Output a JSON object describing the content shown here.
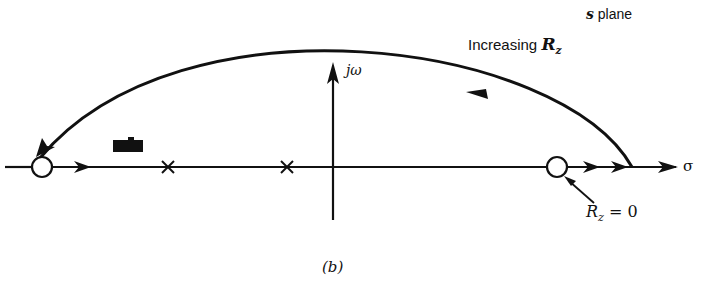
{
  "figure": {
    "plane_label_prefix": "s",
    "plane_label_suffix": " plane",
    "caption": "(b)",
    "colors": {
      "ink": "#111111",
      "background": "#ffffff",
      "redaction": "#111111"
    }
  },
  "axes": {
    "real_axis_label": "σ",
    "imag_axis_label": "jω"
  },
  "annotations": {
    "increasing": {
      "text": "Increasing ",
      "var": "R",
      "sub": "z"
    },
    "zero_start": {
      "var": "R",
      "sub": "z",
      "rest": " = 0"
    }
  },
  "elements": {
    "zeros": [
      {
        "x": 42,
        "y": 167
      },
      {
        "x": 557,
        "y": 167
      }
    ],
    "poles": [
      {
        "x": 168,
        "y": 167
      },
      {
        "x": 287,
        "y": 167
      }
    ],
    "origin": {
      "x": 333,
      "y": 167
    },
    "locus_arc": {
      "start": [
        632,
        167
      ],
      "apex": [
        340,
        40
      ],
      "end": [
        36,
        157
      ],
      "direction": "right-to-left"
    },
    "redaction_box": {
      "x": 113,
      "y": 139,
      "w": 30,
      "h": 13
    }
  }
}
